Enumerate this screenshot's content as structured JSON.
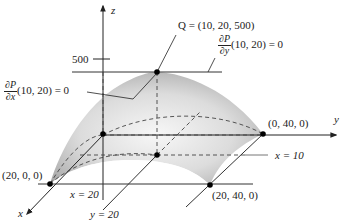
{
  "diagram": {
    "axes": {
      "x": "x",
      "y": "y",
      "z": "z"
    },
    "z_tick": "500",
    "points": {
      "Q": "Q = (10, 20, 500)",
      "y_intercept": "(0, 40, 0)",
      "x_intercept": "(20, 0, 0)",
      "corner": "(20, 40, 0)"
    },
    "partials": {
      "dPdx": {
        "num": "∂P",
        "den": "∂x",
        "value": "(10, 20) = 0"
      },
      "dPdy": {
        "num": "∂P",
        "den": "∂y",
        "value": "(10, 20) = 0"
      }
    },
    "lines": {
      "x10": "x = 10",
      "x20": "x = 20",
      "y20": "y = 20"
    },
    "colors": {
      "surface_light": "#f4f4f4",
      "surface_dark": "#a9a9a9",
      "line": "#333333",
      "point": "#000000"
    }
  }
}
